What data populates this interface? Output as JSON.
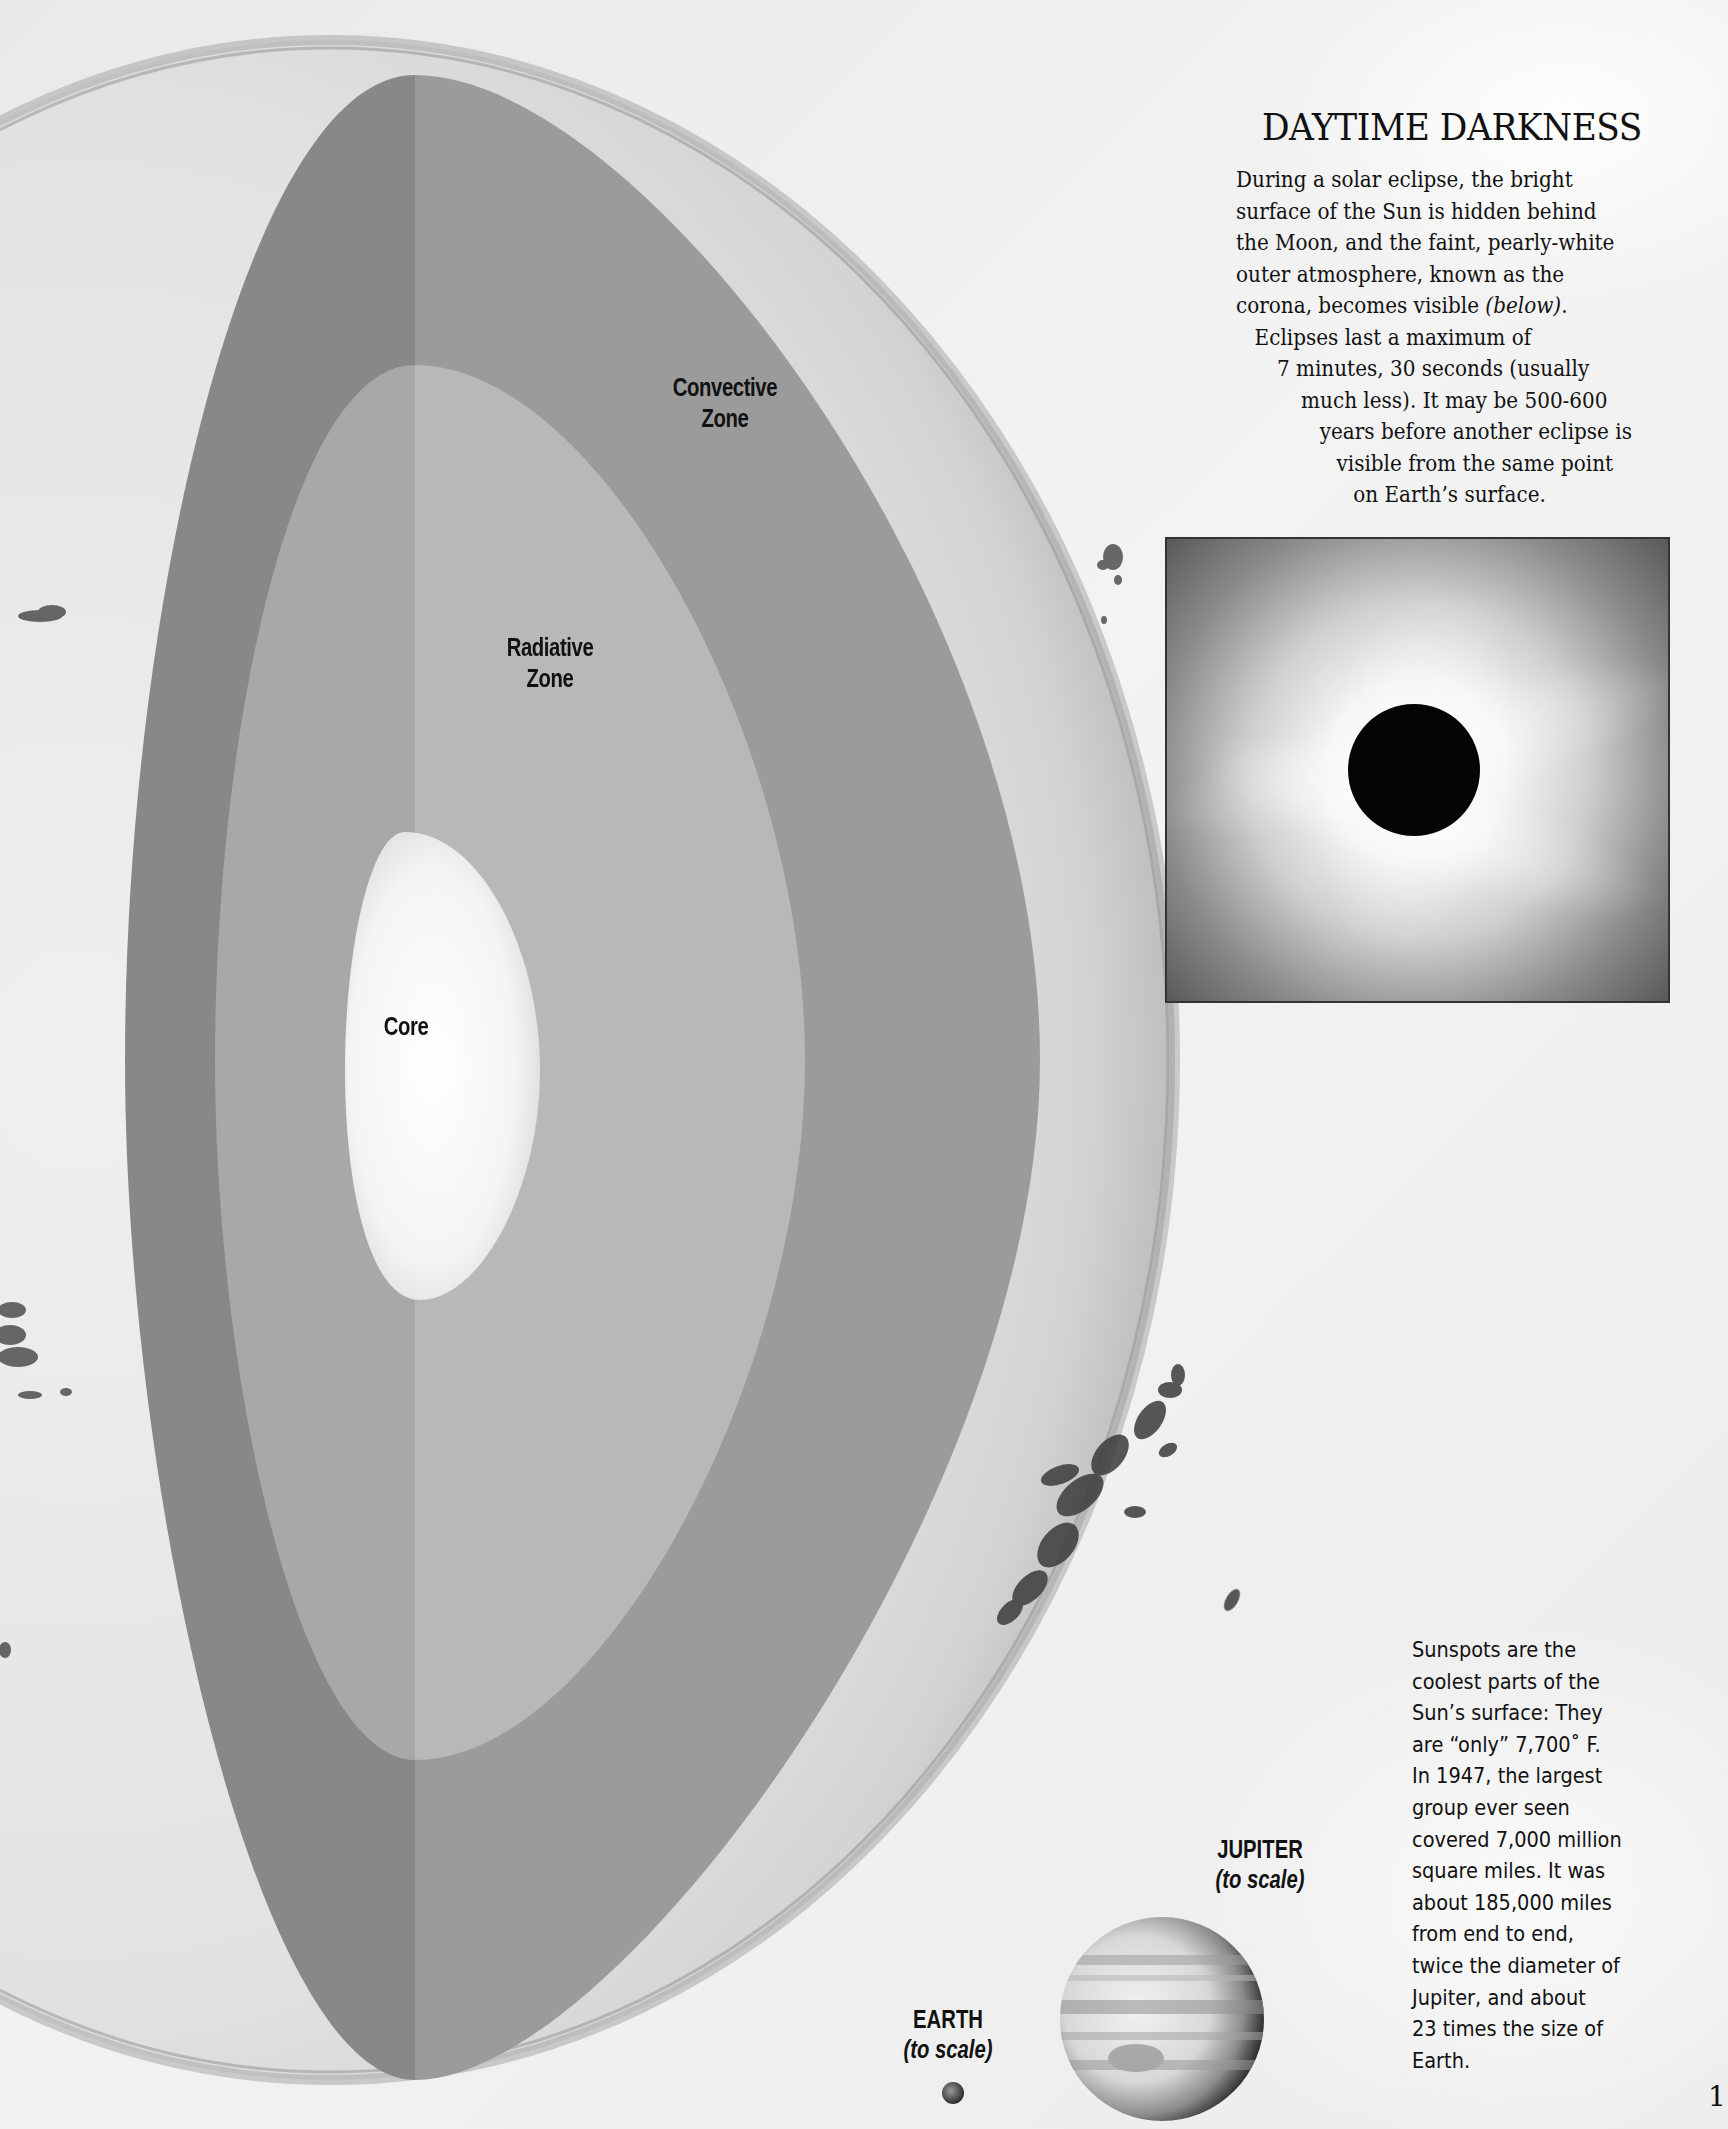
{
  "diagram": {
    "zones": {
      "convective": {
        "label_line1": "Convective",
        "label_line2": "Zone"
      },
      "radiative": {
        "label_line1": "Radiative",
        "label_line2": "Zone"
      },
      "core": {
        "label": "Core"
      }
    },
    "colors": {
      "convective_left": "#888888",
      "convective_right": "#9b9b9b",
      "radiative_left": "#a9a9a9",
      "radiative_right": "#b9b9b9",
      "core": "#f6f6f6",
      "sun_surface": "#e2e2e2",
      "sun_rim": "#9a9a9a"
    }
  },
  "sidebar": {
    "title": "DAYTIME DARKNESS",
    "paragraph_lines": [
      "During a solar eclipse, the bright",
      "surface of the Sun is hidden behind",
      "the Moon, and the faint, pearly-white",
      "outer atmosphere, known as the",
      "corona, becomes visible",
      "Eclipses last a maximum of",
      "7 minutes, 30 seconds (usually",
      "much less). It may be 500-600",
      "years before another eclipse is",
      "visible from the same point",
      "on Earth’s surface."
    ],
    "below_ref": "(below)",
    "below_ref_suffix": "."
  },
  "eclipse_photo": {
    "alt": "Total solar eclipse with corona"
  },
  "sunspot_caption": {
    "lines": [
      "Sunspots are the",
      "coolest parts of the",
      "Sun’s surface: They",
      "are “only” 7,700˚ F.",
      "In 1947, the largest",
      "group ever seen",
      "covered 7,000 million",
      "square miles. It was",
      "about 185,000 miles",
      "from end to end,",
      "twice the diameter of",
      "Jupiter, and about",
      "23 times the size of",
      "Earth."
    ]
  },
  "planets": {
    "jupiter": {
      "name": "JUPITER",
      "note": "(to scale)"
    },
    "earth": {
      "name": "EARTH",
      "note": "(to scale)"
    }
  },
  "page": {
    "number": "1"
  }
}
